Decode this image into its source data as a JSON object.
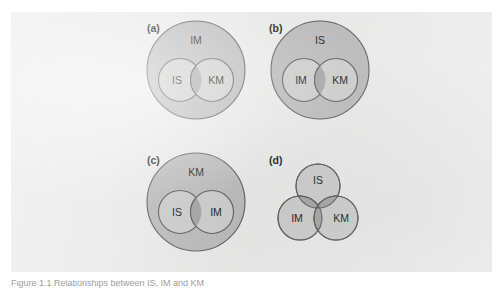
{
  "figure": {
    "caption": "Figure 1.1 Relationships between IS, IM and KM",
    "colors": {
      "page_background": "#ffffff",
      "panel_background": "#ececeb",
      "outer_circle_fill": "#bdbdbd",
      "inner_circle_fill": "#cfcfce",
      "intersection_fill": "#a7a7a6",
      "triple_intersection_fill": "#909090",
      "stroke": "#5f5f5f",
      "label_text": "#1d1d1d"
    },
    "panels": [
      {
        "id": "a",
        "panel_label": "(a)",
        "type": "nested-two-overlapping",
        "outer_label": "IM",
        "left_label": "IS",
        "right_label": "KM"
      },
      {
        "id": "b",
        "panel_label": "(b)",
        "type": "nested-two-overlapping",
        "outer_label": "IS",
        "left_label": "IM",
        "right_label": "KM"
      },
      {
        "id": "c",
        "panel_label": "(c)",
        "type": "nested-two-overlapping",
        "outer_label": "KM",
        "left_label": "IS",
        "right_label": "IM"
      },
      {
        "id": "d",
        "panel_label": "(d)",
        "type": "three-overlapping",
        "top_label": "IS",
        "left_label": "IM",
        "right_label": "KM"
      }
    ]
  }
}
